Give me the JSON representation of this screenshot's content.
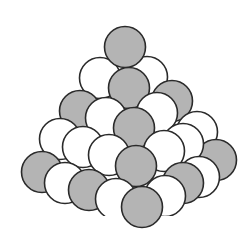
{
  "diagram": {
    "canvas": {
      "width": 242,
      "height": 243,
      "background": "#ffffff"
    },
    "style": {
      "gray_fill": "#b4b4b4",
      "white_fill": "#ffffff",
      "stroke": "#2a2a2a",
      "stroke_width": 1.6,
      "radius": 20.5
    },
    "spheres": [
      {
        "id": "s1",
        "cx": 100,
        "cy": 78,
        "fill": "white"
      },
      {
        "id": "s2",
        "cx": 147,
        "cy": 77,
        "fill": "white"
      },
      {
        "id": "s3",
        "cx": 125,
        "cy": 47,
        "fill": "gray"
      },
      {
        "id": "s4",
        "cx": 80,
        "cy": 111,
        "fill": "gray"
      },
      {
        "id": "s5",
        "cx": 172,
        "cy": 101,
        "fill": "gray"
      },
      {
        "id": "s6",
        "cx": 129,
        "cy": 88,
        "fill": "gray"
      },
      {
        "id": "s7",
        "cx": 60,
        "cy": 139,
        "fill": "white"
      },
      {
        "id": "s8",
        "cx": 197,
        "cy": 132,
        "fill": "white"
      },
      {
        "id": "s9",
        "cx": 106,
        "cy": 118,
        "fill": "white"
      },
      {
        "id": "s10",
        "cx": 157,
        "cy": 113,
        "fill": "white"
      },
      {
        "id": "s11",
        "cx": 134,
        "cy": 128,
        "fill": "gray"
      },
      {
        "id": "s12",
        "cx": 42,
        "cy": 172,
        "fill": "gray"
      },
      {
        "id": "s13",
        "cx": 216,
        "cy": 160,
        "fill": "gray"
      },
      {
        "id": "s14",
        "cx": 83,
        "cy": 147,
        "fill": "white"
      },
      {
        "id": "s15",
        "cx": 183,
        "cy": 144,
        "fill": "white"
      },
      {
        "id": "s16",
        "cx": 109,
        "cy": 155,
        "fill": "white"
      },
      {
        "id": "s17",
        "cx": 164,
        "cy": 151,
        "fill": "white"
      },
      {
        "id": "s18",
        "cx": 136,
        "cy": 166,
        "fill": "gray"
      },
      {
        "id": "s19",
        "cx": 65,
        "cy": 183,
        "fill": "white"
      },
      {
        "id": "s20",
        "cx": 199,
        "cy": 177,
        "fill": "white"
      },
      {
        "id": "s21",
        "cx": 89,
        "cy": 190,
        "fill": "gray"
      },
      {
        "id": "s22",
        "cx": 183,
        "cy": 183,
        "fill": "gray"
      },
      {
        "id": "s23",
        "cx": 116,
        "cy": 199,
        "fill": "white"
      },
      {
        "id": "s24",
        "cx": 165,
        "cy": 196,
        "fill": "white"
      },
      {
        "id": "s25",
        "cx": 142,
        "cy": 207,
        "fill": "gray"
      }
    ]
  }
}
